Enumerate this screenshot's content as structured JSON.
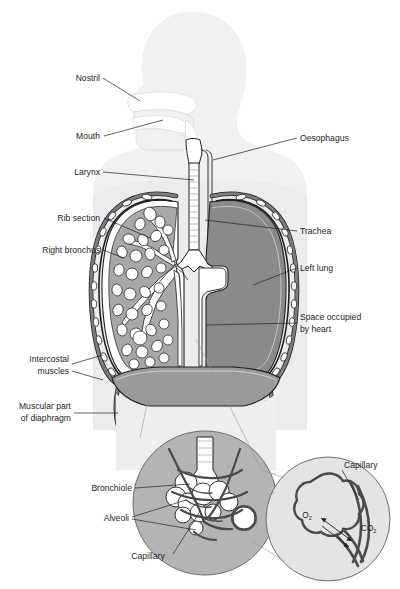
{
  "figure": {
    "domain": "Diagram",
    "background_color": "#ffffff",
    "truncated_caption_top": "",
    "colors": {
      "body_silhouette": "#f1f1f2",
      "torso_silhouette": "#ececee",
      "left_lung_fill": "#8a8a8a",
      "right_lung_fill": "#a8a8a8",
      "bronchial_tissue": "#bcbcbc",
      "alveoli_fill": "#ffffff",
      "rib_fill": "#6e6e6e",
      "rib_highlight": "#ffffff",
      "diaphragm_fill": "#9a9a9a",
      "inset_circle_fill": "#b4b4b4",
      "inset_circle_fill_light": "#e4e4e4",
      "capillary_stroke": "#555555",
      "outline": "#231f20",
      "leader_line": "#231f20",
      "label_text": "#231f20"
    }
  },
  "labels": {
    "left": [
      {
        "id": "nostril",
        "text": "Nostril"
      },
      {
        "id": "mouth",
        "text": "Mouth"
      },
      {
        "id": "larynx",
        "text": "Larynx"
      },
      {
        "id": "rib-section",
        "text": "Rib section"
      },
      {
        "id": "right-bronchus",
        "text": "Right bronchus"
      }
    ],
    "left_multiline": [
      {
        "id": "intercostal-muscles",
        "line1": "Intercostal",
        "line2": "muscles"
      },
      {
        "id": "muscular-part-of-diaphragm",
        "line1": "Muscular part",
        "line2": "of diaphragm"
      }
    ],
    "right": [
      {
        "id": "oesophagus",
        "text": "Oesophagus"
      },
      {
        "id": "trachea",
        "text": "Trachea"
      },
      {
        "id": "left-lung",
        "text": "Left lung"
      }
    ],
    "right_multiline": [
      {
        "id": "space-occupied-by-heart",
        "line1": "Space occupied",
        "line2": "by heart"
      }
    ],
    "inset": [
      {
        "id": "bronchiole",
        "text": "Bronchiole"
      },
      {
        "id": "alveoli",
        "text": "Alveoli"
      },
      {
        "id": "capillary-lower",
        "text": "Capillary"
      },
      {
        "id": "capillary-upper",
        "text": "Capillary"
      }
    ],
    "gases": [
      {
        "id": "oxygen",
        "symbol": "O",
        "subscript": "2"
      },
      {
        "id": "carbon-dioxide",
        "symbol": "CO",
        "subscript": "2"
      }
    ]
  }
}
